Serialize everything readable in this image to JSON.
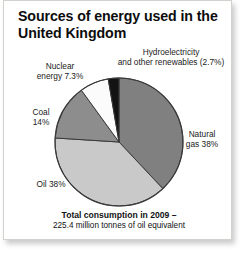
{
  "card": {
    "title": "Sources of energy used\nin the United Kingdom"
  },
  "labels": {
    "hydro": "Hydroelectricity\nand other renewables (2.7%)",
    "nuclear": "Nuclear\nenergy 7.3%",
    "coal": "Coal\n14%",
    "oil": "Oil 38%",
    "gas": "Natural\ngas 38%"
  },
  "footer": {
    "main": "Total consumption in 2009 –",
    "sub": "225.4 million tonnes of oil equivalent"
  },
  "chart_data": {
    "type": "pie",
    "title": "Sources of energy used in the United Kingdom",
    "subtitle": "Total consumption in 2009 – 225.4 million tonnes of oil equivalent",
    "unit": "percent",
    "total_label": "225.4 million tonnes of oil equivalent",
    "year": 2009,
    "start_angle_deg": 0,
    "direction": "clockwise",
    "legend": "none-callout-labels",
    "grid": false,
    "categories": [
      "Natural gas",
      "Oil",
      "Coal",
      "Nuclear energy",
      "Hydroelectricity and other renewables"
    ],
    "values": [
      38,
      38,
      14,
      7.3,
      2.7
    ],
    "colors": [
      "#808080",
      "#c9c9c9",
      "#8d8d8d",
      "#fbfbfb",
      "#131313"
    ],
    "slices": [
      {
        "name": "Natural gas",
        "value": 38,
        "color": "#808080",
        "label": "Natural gas 38%"
      },
      {
        "name": "Oil",
        "value": 38,
        "color": "#c9c9c9",
        "label": "Oil 38%"
      },
      {
        "name": "Coal",
        "value": 14,
        "color": "#8d8d8d",
        "label": "Coal 14%"
      },
      {
        "name": "Nuclear energy",
        "value": 7.3,
        "color": "#fbfbfb",
        "label": "Nuclear energy 7.3%"
      },
      {
        "name": "Hydroelectricity and other renewables",
        "value": 2.7,
        "color": "#131313",
        "label": "Hydroelectricity and other renewables (2.7%)"
      }
    ]
  },
  "geometry": {
    "cx": 115,
    "cy": 141,
    "r": 64,
    "stroke": "#3a3a3a"
  }
}
